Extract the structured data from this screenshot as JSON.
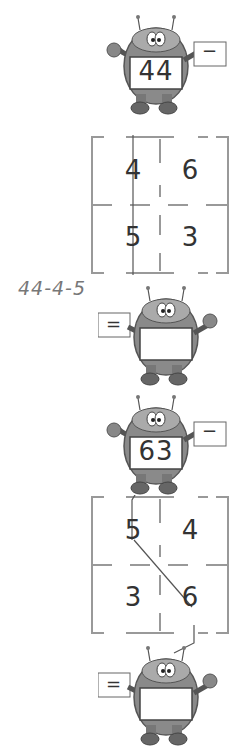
{
  "problems": [
    {
      "start_number": "44",
      "start_operation": "−",
      "grid": [
        "4",
        "6",
        "5",
        "3"
      ],
      "path": [
        "4",
        "5"
      ],
      "end_operation": "=",
      "end_result": "",
      "handwritten_answer": "44-4-5"
    },
    {
      "start_number": "63",
      "start_operation": "−",
      "grid": [
        "5",
        "4",
        "3",
        "6"
      ],
      "path": [
        "5",
        "6"
      ],
      "end_operation": "=",
      "end_result": "",
      "handwritten_answer": ""
    }
  ],
  "colors": {
    "ink": "#333333",
    "grid_line": "#999999",
    "robot_body": "#8a8a8a",
    "handwriting": "#777777"
  }
}
